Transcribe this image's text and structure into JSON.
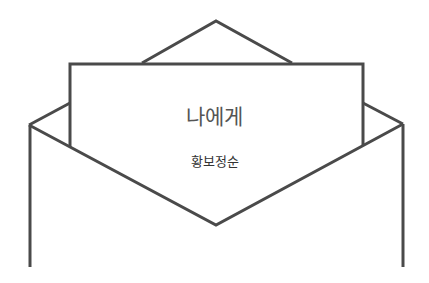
{
  "cover": {
    "title": "나에게",
    "author": "황보정순"
  },
  "colors": {
    "line": "#4a4a4a",
    "background": "#ffffff",
    "title_text": "#555555",
    "author_text": "#333333"
  }
}
